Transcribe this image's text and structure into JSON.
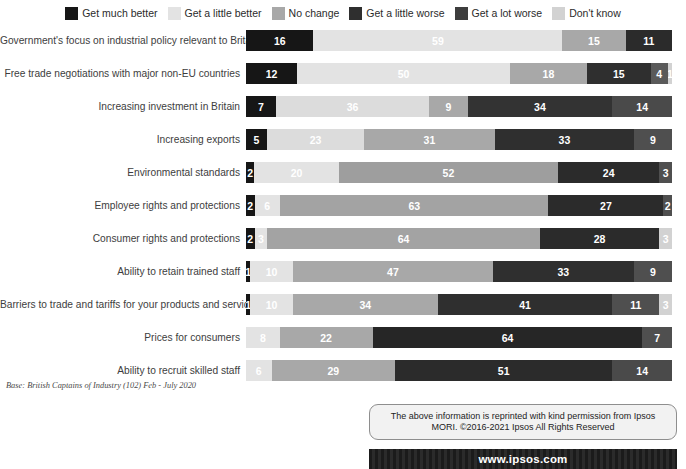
{
  "legend": {
    "items": [
      {
        "label": "Get much better",
        "key": "much_better",
        "color": "#161616",
        "texture": "dark"
      },
      {
        "label": "Get a little better",
        "key": "little_better",
        "color": "#e3e3e3",
        "texture": "light"
      },
      {
        "label": "No change",
        "key": "no_change",
        "color": "#a8a8a8",
        "texture": "light"
      },
      {
        "label": "Get a little worse",
        "key": "little_worse",
        "color": "#2f2f2f",
        "texture": "dark"
      },
      {
        "label": "Get a lot worse",
        "key": "lot_worse",
        "color": "#3d3d3d",
        "texture": "dark"
      },
      {
        "label": "Don't know",
        "key": "dont_know",
        "color": "#d2d2d2",
        "texture": "light"
      }
    ]
  },
  "footnote": "Base: British Captains of Industry (102) Feb - July 2020",
  "permission": {
    "line1": "The above information is reprinted with kind permission from Ipsos",
    "line2": "MORI. ©2016-2021 Ipsos All Rights Reserved"
  },
  "url": "www.ipsos.com",
  "chart_data": {
    "type": "bar",
    "title": "",
    "xlabel": "",
    "ylabel": "",
    "orientation": "horizontal",
    "stacked": true,
    "unit": "percent",
    "xlim": [
      0,
      100
    ],
    "grid": false,
    "legend_position": "top-center",
    "series": [
      {
        "name": "Get much better",
        "color": "#161616"
      },
      {
        "name": "Get a little better",
        "color": "#e3e3e3"
      },
      {
        "name": "No change",
        "color": "#a8a8a8"
      },
      {
        "name": "Get a little worse",
        "color": "#2f2f2f"
      },
      {
        "name": "Get a lot worse",
        "color": "#3d3d3d"
      },
      {
        "name": "Don't know",
        "color": "#d2d2d2"
      }
    ],
    "categories": [
      "Government's focus on industrial policy relevant to Britain",
      "Free trade negotiations with major non-EU countries",
      "Increasing investment in Britain",
      "Increasing exports",
      "Environmental standards",
      "Employee rights and protections",
      "Consumer rights and protections",
      "Ability to retain trained staff",
      "Barriers to trade and tariffs for your products and services",
      "Prices for consumers",
      "Ability to recruit skilled staff"
    ],
    "rows": [
      {
        "category": "Government's focus on industrial policy relevant to Britain",
        "segments": [
          {
            "key": "much_better",
            "value": 16,
            "label": "16",
            "color": "#161616",
            "text": "#ffffff",
            "texture": "dark"
          },
          {
            "key": "little_better",
            "value": 59,
            "label": "59",
            "color": "#e3e3e3",
            "text": "#ffffff",
            "texture": "light"
          },
          {
            "key": "no_change",
            "value": 15,
            "label": "15",
            "color": "#a8a8a8",
            "text": "#ffffff",
            "texture": "light"
          },
          {
            "key": "little_worse",
            "value": 11,
            "label": "11",
            "color": "#2b2b2b",
            "text": "#ffffff",
            "texture": "dark"
          }
        ]
      },
      {
        "category": "Free trade negotiations with major non-EU countries",
        "segments": [
          {
            "key": "much_better",
            "value": 12,
            "label": "12",
            "color": "#161616",
            "text": "#ffffff",
            "texture": "dark"
          },
          {
            "key": "little_better",
            "value": 50,
            "label": "50",
            "color": "#e3e3e3",
            "text": "#ffffff",
            "texture": "light"
          },
          {
            "key": "no_change",
            "value": 18,
            "label": "18",
            "color": "#a8a8a8",
            "text": "#ffffff",
            "texture": "light"
          },
          {
            "key": "little_worse",
            "value": 15,
            "label": "15",
            "color": "#2f2f2f",
            "text": "#ffffff",
            "texture": "dark"
          },
          {
            "key": "lot_worse",
            "value": 4,
            "label": "4",
            "color": "#5a5a5a",
            "text": "#ffffff",
            "texture": "dark"
          },
          {
            "key": "dont_know",
            "value": 1,
            "label": "1",
            "color": "#d2d2d2",
            "text": "#ffffff",
            "texture": "light"
          }
        ]
      },
      {
        "category": "Increasing investment in Britain",
        "segments": [
          {
            "key": "much_better",
            "value": 7,
            "label": "7",
            "color": "#161616",
            "text": "#ffffff",
            "texture": "dark"
          },
          {
            "key": "little_better",
            "value": 36,
            "label": "36",
            "color": "#dcdcdc",
            "text": "#ffffff",
            "texture": "light"
          },
          {
            "key": "no_change",
            "value": 9,
            "label": "9",
            "color": "#a8a8a8",
            "text": "#ffffff",
            "texture": "light"
          },
          {
            "key": "little_worse",
            "value": 34,
            "label": "34",
            "color": "#333333",
            "text": "#ffffff",
            "texture": "dark"
          },
          {
            "key": "lot_worse",
            "value": 14,
            "label": "14",
            "color": "#4a4a4a",
            "text": "#ffffff",
            "texture": "dark"
          }
        ]
      },
      {
        "category": "Increasing exports",
        "segments": [
          {
            "key": "much_better",
            "value": 5,
            "label": "5",
            "color": "#161616",
            "text": "#ffffff",
            "texture": "dark"
          },
          {
            "key": "little_better",
            "value": 23,
            "label": "23",
            "color": "#dcdcdc",
            "text": "#ffffff",
            "texture": "light"
          },
          {
            "key": "no_change",
            "value": 31,
            "label": "31",
            "color": "#a8a8a8",
            "text": "#ffffff",
            "texture": "light"
          },
          {
            "key": "little_worse",
            "value": 33,
            "label": "33",
            "color": "#2f2f2f",
            "text": "#ffffff",
            "texture": "dark"
          },
          {
            "key": "lot_worse",
            "value": 9,
            "label": "9",
            "color": "#4f4f4f",
            "text": "#ffffff",
            "texture": "dark"
          }
        ]
      },
      {
        "category": "Environmental standards",
        "segments": [
          {
            "key": "much_better",
            "value": 2,
            "label": "2",
            "color": "#161616",
            "text": "#ffffff",
            "texture": "dark"
          },
          {
            "key": "little_better",
            "value": 20,
            "label": "20",
            "color": "#e3e3e3",
            "text": "#ffffff",
            "texture": "light"
          },
          {
            "key": "no_change",
            "value": 52,
            "label": "52",
            "color": "#9e9e9e",
            "text": "#ffffff",
            "texture": "light"
          },
          {
            "key": "little_worse",
            "value": 24,
            "label": "24",
            "color": "#2b2b2b",
            "text": "#ffffff",
            "texture": "dark"
          },
          {
            "key": "lot_worse",
            "value": 3,
            "label": "3",
            "color": "#4f4f4f",
            "text": "#ffffff",
            "texture": "dark"
          }
        ]
      },
      {
        "category": "Employee rights and protections",
        "segments": [
          {
            "key": "much_better",
            "value": 2,
            "label": "2",
            "color": "#161616",
            "text": "#ffffff",
            "texture": "dark"
          },
          {
            "key": "little_better",
            "value": 6,
            "label": "6",
            "color": "#e3e3e3",
            "text": "#ffffff",
            "texture": "light"
          },
          {
            "key": "no_change",
            "value": 63,
            "label": "63",
            "color": "#a3a3a3",
            "text": "#ffffff",
            "texture": "light"
          },
          {
            "key": "little_worse",
            "value": 27,
            "label": "27",
            "color": "#2b2b2b",
            "text": "#ffffff",
            "texture": "dark"
          },
          {
            "key": "lot_worse",
            "value": 2,
            "label": "2",
            "color": "#4f4f4f",
            "text": "#ffffff",
            "texture": "dark"
          }
        ]
      },
      {
        "category": "Consumer rights and protections",
        "segments": [
          {
            "key": "much_better",
            "value": 2,
            "label": "2",
            "color": "#161616",
            "text": "#ffffff",
            "texture": "dark"
          },
          {
            "key": "little_better",
            "value": 3,
            "label": "3",
            "color": "#e3e3e3",
            "text": "#ffffff",
            "texture": "light"
          },
          {
            "key": "no_change",
            "value": 64,
            "label": "64",
            "color": "#a3a3a3",
            "text": "#ffffff",
            "texture": "light"
          },
          {
            "key": "little_worse",
            "value": 28,
            "label": "28",
            "color": "#2b2b2b",
            "text": "#ffffff",
            "texture": "dark"
          },
          {
            "key": "lot_worse",
            "value": 3,
            "label": "3",
            "color": "#d2d2d2",
            "text": "#ffffff",
            "texture": "light"
          }
        ]
      },
      {
        "category": "Ability to retain trained staff",
        "segments": [
          {
            "key": "much_better",
            "value": 1,
            "label": "1",
            "color": "#161616",
            "text": "#ffffff",
            "texture": "dark"
          },
          {
            "key": "little_better",
            "value": 10,
            "label": "10",
            "color": "#e3e3e3",
            "text": "#ffffff",
            "texture": "light"
          },
          {
            "key": "no_change",
            "value": 47,
            "label": "47",
            "color": "#a8a8a8",
            "text": "#ffffff",
            "texture": "light"
          },
          {
            "key": "little_worse",
            "value": 33,
            "label": "33",
            "color": "#2f2f2f",
            "text": "#ffffff",
            "texture": "dark"
          },
          {
            "key": "lot_worse",
            "value": 9,
            "label": "9",
            "color": "#4f4f4f",
            "text": "#ffffff",
            "texture": "dark"
          }
        ]
      },
      {
        "category": "Barriers to trade and tariffs for your products and services",
        "segments": [
          {
            "key": "much_better",
            "value": 1,
            "label": "1",
            "color": "#161616",
            "text": "#ffffff",
            "texture": "dark"
          },
          {
            "key": "little_better",
            "value": 10,
            "label": "10",
            "color": "#e3e3e3",
            "text": "#ffffff",
            "texture": "light"
          },
          {
            "key": "no_change",
            "value": 34,
            "label": "34",
            "color": "#a8a8a8",
            "text": "#ffffff",
            "texture": "light"
          },
          {
            "key": "little_worse",
            "value": 41,
            "label": "41",
            "color": "#2f2f2f",
            "text": "#ffffff",
            "texture": "dark"
          },
          {
            "key": "lot_worse",
            "value": 11,
            "label": "11",
            "color": "#4f4f4f",
            "text": "#ffffff",
            "texture": "dark"
          },
          {
            "key": "dont_know",
            "value": 3,
            "label": "3",
            "color": "#d2d2d2",
            "text": "#ffffff",
            "texture": "light"
          }
        ]
      },
      {
        "category": "Prices for consumers",
        "segments": [
          {
            "key": "little_better",
            "value": 8,
            "label": "8",
            "color": "#e3e3e3",
            "text": "#ffffff",
            "texture": "light"
          },
          {
            "key": "no_change",
            "value": 22,
            "label": "22",
            "color": "#a8a8a8",
            "text": "#ffffff",
            "texture": "light"
          },
          {
            "key": "little_worse",
            "value": 64,
            "label": "64",
            "color": "#262626",
            "text": "#ffffff",
            "texture": "dark"
          },
          {
            "key": "lot_worse",
            "value": 7,
            "label": "7",
            "color": "#4f4f4f",
            "text": "#ffffff",
            "texture": "dark"
          }
        ]
      },
      {
        "category": "Ability to recruit skilled staff",
        "segments": [
          {
            "key": "little_better",
            "value": 6,
            "label": "6",
            "color": "#e3e3e3",
            "text": "#ffffff",
            "texture": "light"
          },
          {
            "key": "no_change",
            "value": 29,
            "label": "29",
            "color": "#a8a8a8",
            "text": "#ffffff",
            "texture": "light"
          },
          {
            "key": "little_worse",
            "value": 51,
            "label": "51",
            "color": "#2b2b2b",
            "text": "#ffffff",
            "texture": "dark"
          },
          {
            "key": "lot_worse",
            "value": 14,
            "label": "14",
            "color": "#4a4a4a",
            "text": "#ffffff",
            "texture": "dark"
          }
        ]
      }
    ]
  }
}
